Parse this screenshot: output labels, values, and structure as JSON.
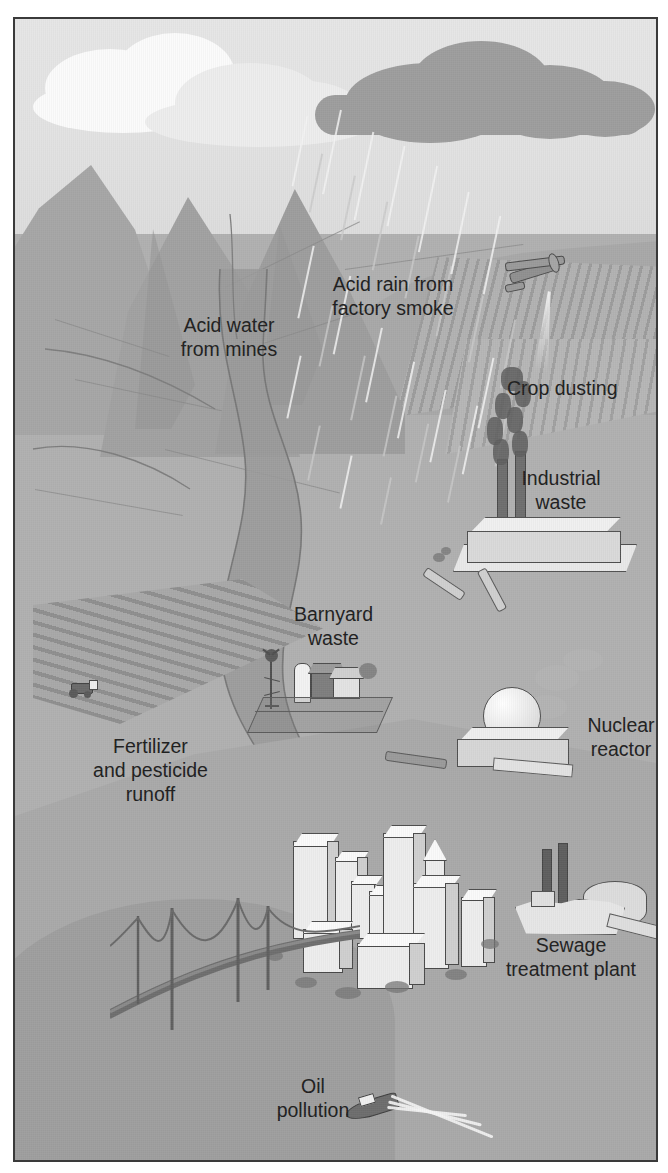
{
  "figure": {
    "style": "grayscale landscape illustration",
    "border_color": "#3a3a3a",
    "background_color": "#b9b9b9"
  },
  "labels": [
    {
      "id": "acid-water-from-mines",
      "text": "Acid water\nfrom mines"
    },
    {
      "id": "acid-rain-from-factory-smoke",
      "text": "Acid rain from\nfactory smoke"
    },
    {
      "id": "crop-dusting",
      "text": "Crop dusting"
    },
    {
      "id": "industrial-waste",
      "text": "Industrial\nwaste"
    },
    {
      "id": "barnyard-waste",
      "text": "Barnyard\nwaste"
    },
    {
      "id": "fertilizer-and-pesticide-runoff",
      "text": "Fertilizer\nand pesticide\nrunoff"
    },
    {
      "id": "nuclear-reactor",
      "text": "Nuclear\nreactor"
    },
    {
      "id": "sewage-treatment-plant",
      "text": "Sewage\ntreatment plant"
    },
    {
      "id": "oil-pollution",
      "text": "Oil\npollution"
    }
  ],
  "scene_elements": {
    "storm_cloud": "dark-storm-cloud",
    "white_clouds": "white-cumulus-clouds",
    "rain": "acid-rain-streaks",
    "mountains": "mountain-range",
    "river": "winding-river",
    "plowed_field": "plowed-crop-field",
    "tractor": "tractor",
    "farm": "barn-silo-windmill",
    "factory": "factory-with-smokestacks",
    "crop_duster": "biplane-crop-duster",
    "reactor": "nuclear-reactor-dome",
    "city": "city-skyscrapers",
    "bridge": "suspension-bridge",
    "sewage_plant": "sewage-treatment-plant",
    "boat": "motorboat"
  }
}
